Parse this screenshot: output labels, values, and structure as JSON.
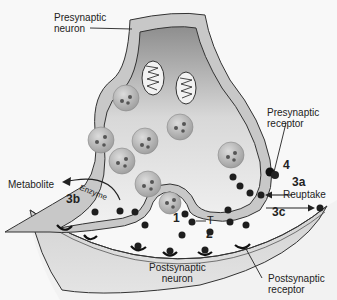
{
  "diagram": {
    "labels": {
      "presynaptic_neuron": [
        "Presynaptic",
        "neuron"
      ],
      "presynaptic_receptor": [
        "Presynaptic",
        "receptor"
      ],
      "postsynaptic_neuron": [
        "Postsynaptic",
        "neuron"
      ],
      "postsynaptic_receptor": [
        "Postsynaptic",
        "receptor"
      ],
      "metabolite": "Metabolite",
      "enzyme": "Enzyme",
      "reuptake": "Reuptake",
      "transmitter": "T"
    },
    "steps": {
      "s1": "1",
      "s2": "2",
      "s3a": "3a",
      "s3b": "3b",
      "s3c": "3c",
      "s4": "4"
    },
    "colors": {
      "membrane_fill": "#c9c9c9",
      "cytoplasm_dark": "#9a9a9a",
      "cytoplasm_light": "#eeeeee",
      "vesicle": "#b8b8b8",
      "transmitter": "#1e1e1e",
      "outline": "#333333"
    }
  }
}
